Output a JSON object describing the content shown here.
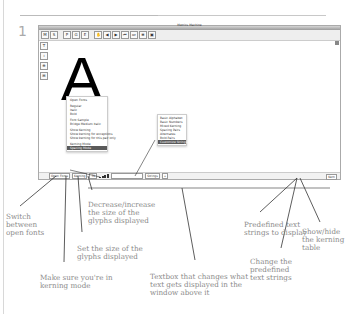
{
  "step_number": "1",
  "window": {
    "title": "Metrics Machine",
    "toolbar_icons": [
      "metrics-icon",
      "spacing-icon",
      "pair-icon",
      "group-icon",
      "exception-icon",
      "hand-icon",
      "prev-icon",
      "next-icon",
      "first-icon",
      "last-icon",
      "compare-icon",
      "preview-icon"
    ],
    "side_tools": [
      "text-tool-icon",
      "pair-tool-icon",
      "zoom-tool-icon",
      "ruler-tool-icon"
    ],
    "glyph_display": "A",
    "font_menu": {
      "items": [
        "Open Fonts",
        "",
        "Regular",
        "Italic",
        "Bold",
        "",
        "Font Sample",
        "Bridge Medium Italic",
        "",
        "Show Kerning",
        "Show kerning for exceptions",
        "Show kerning for this pair only",
        "",
        "Kerning Mode",
        "Spacing Mode"
      ],
      "highlighted": "Kerning Mode"
    },
    "text_menu": {
      "items": [
        "Basic Alphabet",
        "Basic Numbers",
        "",
        "Mixed Kerning",
        "Spacing Pairs",
        "Alternates",
        "Bold Pairs",
        "Customize Strings..."
      ],
      "highlighted": "Customize Strings..."
    },
    "statusbar": {
      "font_switch": "Open Fonts",
      "mode": "Kerning",
      "size_value": "72",
      "size_label": "Size",
      "text_value": "",
      "string_select": "Strings",
      "kerning_toggle": "Kern"
    }
  },
  "callouts": [
    {
      "id": "switch-fonts",
      "text": "Switch between open fonts"
    },
    {
      "id": "kerning-mode",
      "text": "Make sure you're in kerning mode"
    },
    {
      "id": "set-size",
      "text": "Set the size of the glyphs displayed"
    },
    {
      "id": "size-step",
      "text": "Decrease/increase the size of the glyphs displayed"
    },
    {
      "id": "textbox",
      "text": "Textbox that changes what text gets displayed in the window above it"
    },
    {
      "id": "predefined",
      "text": "Predefined text strings to display"
    },
    {
      "id": "change-predefined",
      "text": "Change the predefined text strings"
    },
    {
      "id": "show-kerning",
      "text": "Show/hide the kerning table"
    }
  ]
}
